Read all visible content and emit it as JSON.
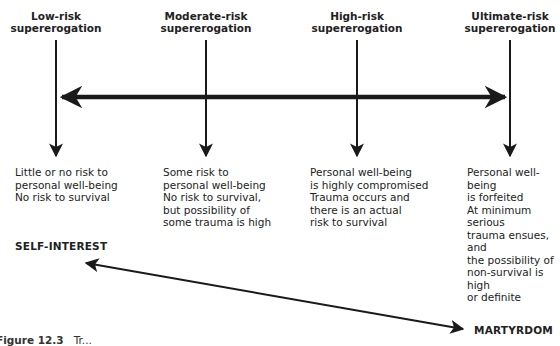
{
  "figure": {
    "categories": [
      {
        "header_line1": "Low-risk",
        "header_line2": "supererogation",
        "description": "Little or no risk to\npersonal well-being\nNo risk to survival"
      },
      {
        "header_line1": "Moderate-risk",
        "header_line2": "supererogation",
        "description": "Some risk to\npersonal well-being\nNo risk to survival,\nbut possibility of\nsome trauma is high"
      },
      {
        "header_line1": "High-risk",
        "header_line2": "supererogation",
        "description": "Personal well-being\nis highly compromised\nTrauma occurs and\nthere is an actual\nrisk to survival"
      },
      {
        "header_line1": "Ultimate-risk",
        "header_line2": "supererogation",
        "description": "Personal well-being\nis forfeited\nAt minimum serious\ntrauma ensues, and\nthe possibility of\nnon-survival is high\nor definite"
      }
    ],
    "poles": {
      "left": "SELF-INTEREST",
      "right": "MARTYRDOM"
    },
    "caption": {
      "label": "Figure 12.3",
      "text": "Tr..."
    },
    "colors": {
      "line": "#1a1a1a",
      "text": "#222222",
      "background": "#ffffff"
    }
  }
}
